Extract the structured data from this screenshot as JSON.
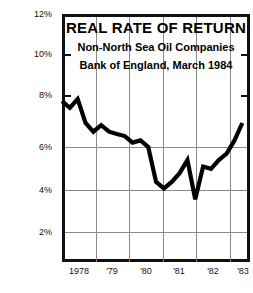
{
  "chart_data": {
    "type": "line",
    "title": "REAL RATE OF RETURN",
    "subtitle_1": "Non-North Sea Oil Companies",
    "subtitle_2": "Bank of England, March 1984",
    "xlabel": "",
    "ylabel": "",
    "ylim": [
      0,
      12
    ],
    "xlim": [
      1978,
      1983.9
    ],
    "grid": true,
    "legend": "none",
    "y_ticks": [
      2,
      4,
      6,
      8,
      10,
      12
    ],
    "y_tick_labels": [
      "2%",
      "4%",
      "6%",
      "8%",
      "10%",
      "12%"
    ],
    "x_ticks": [
      1978,
      1979,
      1980,
      1981,
      1982,
      1983
    ],
    "x_tick_labels": [
      "1978",
      "'79",
      "'80",
      "'81",
      "'82",
      "'83"
    ],
    "series": [
      {
        "name": "Real rate of return",
        "x": [
          1978.0,
          1978.25,
          1978.5,
          1978.75,
          1979.0,
          1979.25,
          1979.5,
          1979.75,
          1980.0,
          1980.25,
          1980.5,
          1980.75,
          1981.0,
          1981.25,
          1981.5,
          1981.75,
          1982.0,
          1982.25,
          1982.5,
          1982.75,
          1983.0,
          1983.25,
          1983.5,
          1983.75
        ],
        "values": [
          8.0,
          7.7,
          8.1,
          7.0,
          6.6,
          6.9,
          6.6,
          6.5,
          6.4,
          6.1,
          6.2,
          5.9,
          4.3,
          4.0,
          4.3,
          4.7,
          5.3,
          3.5,
          5.0,
          4.9,
          5.3,
          5.6,
          6.2,
          7.0
        ]
      }
    ]
  },
  "axes": {
    "y_label_2": "2%",
    "y_label_4": "4%",
    "y_label_6": "6%",
    "y_label_8": "8%",
    "y_label_10": "10%",
    "y_label_12": "12%",
    "x_label_1978": "1978",
    "x_label_79": "'79",
    "x_label_80": "'80",
    "x_label_81": "'81",
    "x_label_82": "'82",
    "x_label_83": "'83"
  },
  "colors": {
    "line": "#000000",
    "frame": "#111111",
    "grid": "#8a8a8a",
    "background": "#ffffff"
  }
}
